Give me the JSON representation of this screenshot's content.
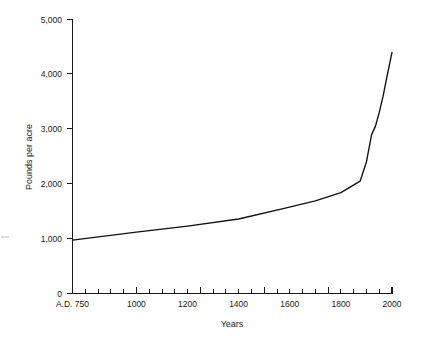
{
  "chart_data": {
    "type": "line",
    "title": "",
    "xlabel": "Years",
    "ylabel": "Pounds per acre",
    "xlim": [
      750,
      2000
    ],
    "ylim": [
      0,
      5000
    ],
    "grid": false,
    "legend": null,
    "x_tick_labels": [
      "A.D. 750",
      "1000",
      "1200",
      "1400",
      "1600",
      "1800",
      "2000"
    ],
    "x_tick_values": [
      750,
      1000,
      1200,
      1400,
      1600,
      1800,
      2000
    ],
    "x_minor_step": 50,
    "y_tick_labels": [
      "0",
      "1,000",
      "2,000",
      "3,000",
      "4,000",
      "5,000"
    ],
    "y_tick_values": [
      0,
      1000,
      2000,
      3000,
      4000,
      5000
    ],
    "series": [
      {
        "name": "Yield",
        "x": [
          750,
          1000,
          1200,
          1400,
          1570,
          1700,
          1800,
          1875,
          1900,
          1920,
          1935,
          1950,
          1965,
          1980,
          2000
        ],
        "values": [
          975,
          1120,
          1230,
          1360,
          1545,
          1690,
          1840,
          2050,
          2400,
          2900,
          3050,
          3300,
          3600,
          3950,
          4400
        ]
      }
    ],
    "line_color": "#111111",
    "axis_color": "#1a1a1a",
    "background_color": "#ffffff"
  },
  "axis_titles": {
    "x": "Years",
    "y": "Pounds per acre"
  },
  "y_labels": {
    "t0": "0",
    "t1": "1,000",
    "t2": "2,000",
    "t3": "3,000",
    "t4": "4,000",
    "t5": "5,000"
  },
  "x_labels": {
    "t0": "A.D. 750",
    "t1": "1000",
    "t2": "1200",
    "t3": "1400",
    "t4": "1600",
    "t5": "1800",
    "t6": "2000"
  }
}
